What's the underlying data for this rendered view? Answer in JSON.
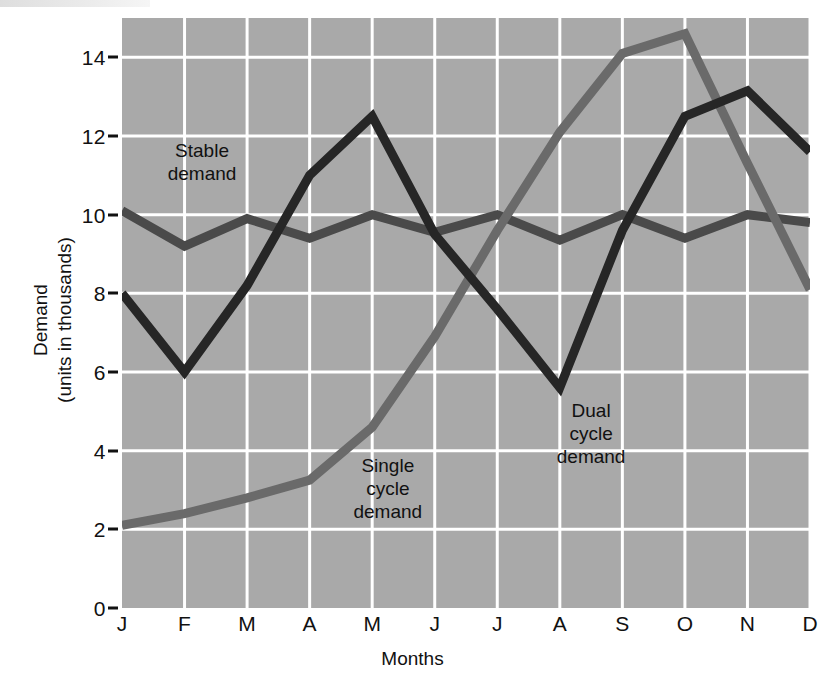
{
  "chart_data": {
    "type": "line",
    "title": "",
    "xlabel": "Months",
    "ylabel": "Demand\n(units in thousands)",
    "ylabel_line1": "Demand",
    "ylabel_line2": "(units in thousands)",
    "categories": [
      "J",
      "F",
      "M",
      "A",
      "M",
      "J",
      "J",
      "A",
      "S",
      "O",
      "N",
      "D"
    ],
    "ytick_labels": [
      "0",
      "2",
      "4",
      "6",
      "8",
      "10",
      "12",
      "14"
    ],
    "ytick_values": [
      0,
      2,
      4,
      6,
      8,
      10,
      12,
      14
    ],
    "ylim": [
      0,
      15
    ],
    "xlim": [
      0,
      11
    ],
    "grid": true,
    "grid_color": "#ffffff",
    "plot_background": "#a9a9a9",
    "legend": "inline-annotations",
    "series": [
      {
        "name": "Stable demand",
        "color": "#4a4a4a",
        "line_width": 9,
        "values": [
          10.1,
          9.2,
          9.9,
          9.4,
          10.0,
          9.55,
          10.0,
          9.35,
          10.0,
          9.4,
          10.0,
          9.8
        ]
      },
      {
        "name": "Single cycle demand",
        "color": "#6a6a6a",
        "line_width": 9,
        "values": [
          2.1,
          2.4,
          2.8,
          3.25,
          4.6,
          6.9,
          9.6,
          12.1,
          14.1,
          14.6,
          11.3,
          8.1
        ]
      },
      {
        "name": "Dual cycle demand",
        "color": "#262626",
        "line_width": 9,
        "values": [
          8.0,
          6.0,
          8.2,
          11.0,
          12.5,
          9.5,
          7.6,
          5.6,
          9.6,
          12.5,
          13.15,
          11.6
        ]
      }
    ],
    "annotations": [
      {
        "text": "Stable\ndemand",
        "x_month": 1.28,
        "y_value": 11.35
      },
      {
        "text": "Single\ncycle\ndemand",
        "x_month": 4.25,
        "y_value": 3.05
      },
      {
        "text": "Dual\ncycle\ndemand",
        "x_month": 7.5,
        "y_value": 4.45
      }
    ]
  }
}
